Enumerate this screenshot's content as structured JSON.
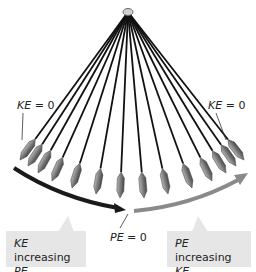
{
  "diagram": {
    "labels": {
      "ke_zero_left": {
        "var": "KE",
        "eq": " = 0"
      },
      "ke_zero_right": {
        "var": "KE",
        "eq": " = 0"
      },
      "pe_zero": {
        "var": "PE",
        "eq": " = 0"
      }
    },
    "boxes": {
      "left": {
        "line1_var": "KE",
        "line1_text": " increasing",
        "line2_var": "PE",
        "line2_text": " decreasing"
      },
      "right": {
        "line1_var": "PE",
        "line1_text": " increasing",
        "line2_var": "KE",
        "line2_text": " decreasing"
      }
    },
    "pendulum": {
      "positions": 14,
      "pivot": [
        128,
        12
      ]
    },
    "colors": {
      "left_arrow": "#1a1a1a",
      "right_arrow": "#8a8a8a",
      "box_bg": "#e6e6e6",
      "string": "#111111",
      "bob": "#888888"
    }
  }
}
